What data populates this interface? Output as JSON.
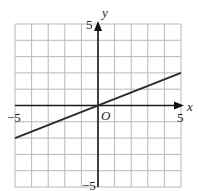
{
  "chart_data": {
    "type": "line",
    "title": "",
    "xlabel": "x",
    "ylabel": "y",
    "origin_label": "O",
    "xlim": [
      -5,
      5
    ],
    "ylim": [
      -5,
      5
    ],
    "grid": true,
    "grid_step": 1,
    "tick_labels": {
      "x_min": "−5",
      "x_max": "5",
      "y_min": "−5",
      "y_max": "5"
    },
    "series": [
      {
        "name": "line",
        "x": [
          -5,
          5
        ],
        "y": [
          -2,
          2
        ],
        "equation": "y = 0.4x"
      }
    ]
  }
}
